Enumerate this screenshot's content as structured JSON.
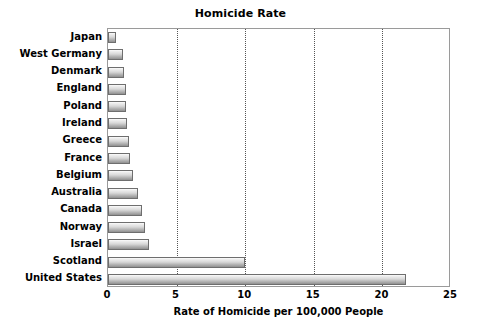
{
  "chart_data": {
    "type": "bar",
    "orientation": "horizontal",
    "title": "Homicide Rate",
    "xlabel": "Rate of Homicide per 100,000 People",
    "ylabel": "",
    "xlim": [
      0,
      25
    ],
    "xticks": [
      0,
      5,
      10,
      15,
      20,
      25
    ],
    "xtick_labels": [
      "0",
      "5",
      "10",
      "15",
      "20",
      "25"
    ],
    "grid": "vertical-dotted",
    "legend": "none",
    "categories": [
      "Japan",
      "West Germany",
      "Denmark",
      "England",
      "Poland",
      "Ireland",
      "Greece",
      "France",
      "Belgium",
      "Australia",
      "Canada",
      "Norway",
      "Israel",
      "Scotland",
      "United States"
    ],
    "values": [
      0.6,
      1.1,
      1.2,
      1.3,
      1.3,
      1.4,
      1.5,
      1.6,
      1.8,
      2.2,
      2.5,
      2.7,
      3.0,
      10.0,
      21.7
    ],
    "bar_fill": "#c8c8c8",
    "bar_border": "#6e6e6e",
    "grid_color": "#555555",
    "plot_border": "#9a9a9a",
    "background": "#ffffff"
  }
}
